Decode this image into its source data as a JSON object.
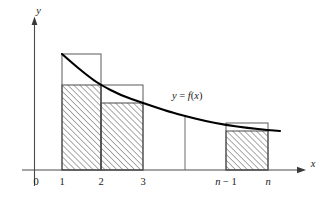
{
  "figure": {
    "background_color": "#ffffff",
    "curve_color": "#000000",
    "axis_color": "#4a4a4a",
    "outline_color": "#5a5a5a",
    "hatch_color": "#4a4a4a"
  },
  "axes": {
    "x_label": "x",
    "y_label": "y",
    "origin_label": "0",
    "x_tick_labels": [
      "1",
      "2",
      "3",
      "n − 1",
      "n"
    ],
    "x_axis_y_px": 170,
    "y_axis_x_px": 34
  },
  "curve": {
    "label": "y = f(x)",
    "label_parts": {
      "y": "y",
      "equals": "=",
      "f": "f",
      "paren_open": "(",
      "x": "x",
      "paren_close": ")"
    },
    "description": "decreasing convex function"
  },
  "chart_data": {
    "type": "area",
    "title": "",
    "xlabel": "x",
    "ylabel": "y",
    "grid": false,
    "legend": "none",
    "curve_label": "y = f(x)",
    "x_ticks": [
      {
        "label": "1",
        "px": 62
      },
      {
        "label": "2",
        "px": 101
      },
      {
        "label": "3",
        "px": 143
      },
      {
        "label": "n − 1",
        "px": 226
      },
      {
        "label": "n",
        "px": 268
      }
    ],
    "curve_points_px": [
      [
        62,
        54
      ],
      [
        78,
        68
      ],
      [
        92,
        79
      ],
      [
        101,
        85
      ],
      [
        120,
        95
      ],
      [
        143,
        103
      ],
      [
        170,
        112
      ],
      [
        185,
        116
      ],
      [
        205,
        121
      ],
      [
        226,
        125
      ],
      [
        248,
        128
      ],
      [
        268,
        130
      ],
      [
        280,
        131
      ]
    ],
    "outline_rectangles": [
      {
        "interval": "[1,2]",
        "x0_px": 62,
        "x1_px": 101,
        "top_px": 54,
        "height_label": "f(1)"
      },
      {
        "interval": "[2,3]",
        "x0_px": 101,
        "x1_px": 143,
        "top_px": 85,
        "height_label": "f(2)"
      },
      {
        "interval": "[n-1,n]",
        "x0_px": 226,
        "x1_px": 268,
        "top_px": 123,
        "height_label": "f(n-1)"
      }
    ],
    "hatched_rectangles": [
      {
        "interval": "[1,2]",
        "x0_px": 62,
        "x1_px": 101,
        "top_px": 85,
        "height_label": "f(2)"
      },
      {
        "interval": "[2,3]",
        "x0_px": 101,
        "x1_px": 143,
        "top_px": 103,
        "height_label": "f(3)"
      },
      {
        "interval": "[n-1,n]",
        "x0_px": 226,
        "x1_px": 268,
        "top_px": 131,
        "height_label": "f(n)"
      }
    ],
    "divider_line": {
      "x_px": 185,
      "top_px": 116,
      "bottom_px": 170
    }
  }
}
